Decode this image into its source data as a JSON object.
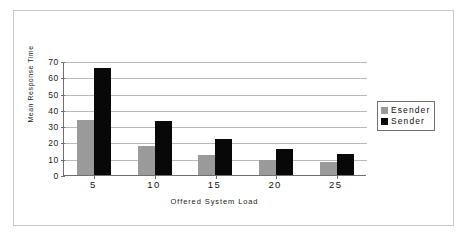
{
  "chart_data": {
    "type": "bar",
    "title": "",
    "xlabel": "Offered System Load",
    "ylabel": "Mean Response Time",
    "categories": [
      "5",
      "10",
      "15",
      "20",
      "25"
    ],
    "series": [
      {
        "name": "Esender",
        "color": "#9a9a9a",
        "values": [
          34,
          18,
          12,
          9.5,
          8
        ]
      },
      {
        "name": "Sender",
        "color": "#080808",
        "values": [
          66,
          33,
          22,
          16,
          13
        ]
      }
    ],
    "ylim": [
      0,
      70
    ],
    "ytick_labels": [
      "0",
      "10",
      "20",
      "30",
      "40",
      "50",
      "60",
      "70"
    ],
    "ytick_values": [
      0,
      10,
      20,
      30,
      40,
      50,
      60,
      70
    ],
    "grid": "horizontal",
    "legend_position": "right",
    "legend_border": true,
    "plot_background": "#ffffff",
    "axis_color": "#6f6f6f",
    "gridline_color": "#b8b8b8",
    "figure_border_color": "#c9c9c9"
  },
  "legend": {
    "entries": [
      {
        "label": "Esender"
      },
      {
        "label": "Sender"
      }
    ]
  }
}
